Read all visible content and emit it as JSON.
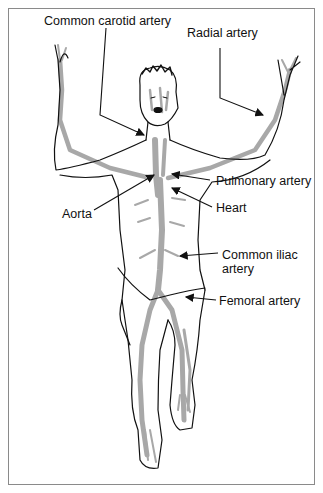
{
  "diagram": {
    "labels": {
      "common_carotid": "Common carotid artery",
      "radial": "Radial artery",
      "pulmonary": "Pulmonary artery",
      "aorta": "Aorta",
      "heart": "Heart",
      "common_iliac_line1": "Common iliac",
      "common_iliac_line2": "artery",
      "femoral": "Femoral artery"
    },
    "colors": {
      "outline": "#111111",
      "artery": "#a8a8a8",
      "frame": "#8a8a8a",
      "background": "#ffffff"
    }
  }
}
